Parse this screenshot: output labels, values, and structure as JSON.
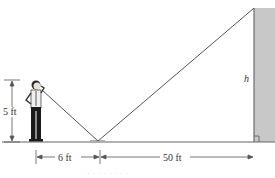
{
  "diagram": {
    "person_height_label": "5 ft",
    "distance_person_to_mirror_label": "6 ft",
    "distance_mirror_to_building_label": "50 ft",
    "building_height_label": "h",
    "caption": "· · · · · · · · ·",
    "colors": {
      "line": "#555555",
      "building_fill": "#c8c8c8",
      "building_edge": "#666666",
      "mirror": "#b0b0b0",
      "person_dark": "#1a1a1a"
    }
  }
}
